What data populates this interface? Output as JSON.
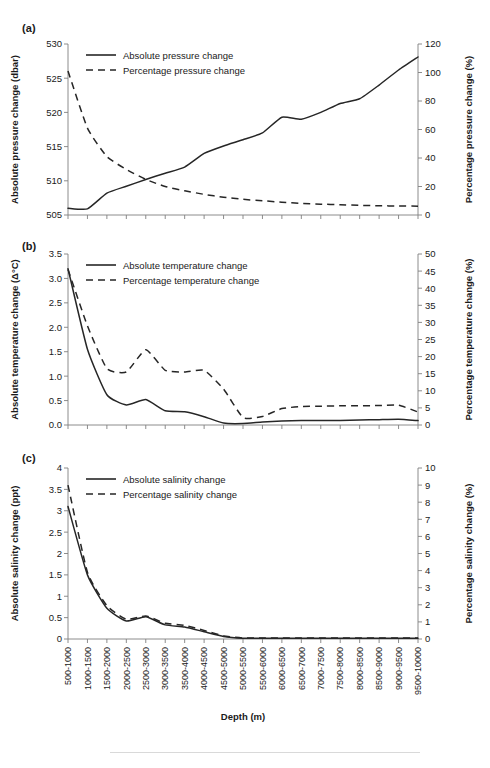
{
  "figure": {
    "xlabel": "Depth (m)",
    "categories": [
      "500-1000",
      "1000-1500",
      "1500-2000",
      "2000-2500",
      "2500-3000",
      "3000-3500",
      "3500-4000",
      "4000-4500",
      "4500-5000",
      "5000-5500",
      "5500-6000",
      "6000-6500",
      "6500-7000",
      "7000-7500",
      "7500-8000",
      "8000-8500",
      "8500-9000",
      "9000-9500",
      "9500-10000"
    ]
  },
  "panels": [
    {
      "tag": "(a)",
      "ylabel_left": "Absolute pressure change (dbar)",
      "ylabel_right": "Percentage pressure change (%)",
      "yticks_left": [
        "505",
        "510",
        "515",
        "520",
        "525",
        "530"
      ],
      "yticks_right": [
        "0",
        "20",
        "40",
        "60",
        "80",
        "100",
        "120"
      ],
      "legend": [
        "Absolute pressure change",
        "Percentage pressure change"
      ]
    },
    {
      "tag": "(b)",
      "ylabel_left": "Absolute temperature change (Δ°C)",
      "ylabel_right": "Percentage temperature change (%)",
      "yticks_left": [
        "0.0",
        "0.5",
        "1.0",
        "1.5",
        "2.0",
        "2.5",
        "3.0",
        "3.5"
      ],
      "yticks_right": [
        "0",
        "5",
        "10",
        "15",
        "20",
        "25",
        "30",
        "35",
        "40",
        "45",
        "50"
      ],
      "legend": [
        "Absolute temperature change",
        "Percentage temperature change"
      ]
    },
    {
      "tag": "(c)",
      "ylabel_left": "Absolute salinity change (ppt)",
      "ylabel_right": "Percentage salinity change (%)",
      "yticks_left": [
        "0",
        "0.5",
        "1",
        "1.5",
        "2",
        "2.5",
        "3",
        "3.5",
        "4"
      ],
      "yticks_right": [
        "0",
        "1",
        "2",
        "3",
        "4",
        "5",
        "6",
        "7",
        "8",
        "9",
        "10"
      ],
      "legend": [
        "Absolute salinity change",
        "Percentage salinity change"
      ]
    }
  ],
  "chart_data": [
    {
      "type": "line",
      "panel": "(a)",
      "title": "",
      "xlabel": "Depth (m)",
      "ylabel": "Absolute pressure change (dbar)",
      "ylabel_right": "Percentage pressure change (%)",
      "grid": false,
      "legend_position": "top-left",
      "categories": [
        "500-1000",
        "1000-1500",
        "1500-2000",
        "2000-2500",
        "2500-3000",
        "3000-3500",
        "3500-4000",
        "4000-4500",
        "4500-5000",
        "5000-5500",
        "5500-6000",
        "6000-6500",
        "6500-7000",
        "7000-7500",
        "7500-8000",
        "8000-8500",
        "8500-9000",
        "9000-9500",
        "9500-10000"
      ],
      "ylim": [
        505,
        530
      ],
      "ylim_right": [
        0,
        120
      ],
      "series": [
        {
          "name": "Absolute pressure change",
          "axis": "left",
          "style": "solid",
          "values": [
            506.0,
            505.9,
            508.2,
            509.2,
            510.2,
            511.1,
            512.0,
            514.0,
            515.1,
            516.0,
            517.0,
            519.3,
            519.0,
            520.0,
            521.3,
            522.0,
            524.0,
            526.2,
            528.1
          ]
        },
        {
          "name": "Percentage pressure change",
          "axis": "right",
          "style": "dashed",
          "values": [
            101.0,
            61.0,
            41.0,
            32.0,
            25.0,
            20.0,
            17.0,
            14.5,
            12.5,
            11.0,
            10.0,
            9.0,
            8.2,
            7.6,
            7.2,
            6.8,
            6.5,
            6.3,
            6.2
          ]
        }
      ]
    },
    {
      "type": "line",
      "panel": "(b)",
      "title": "",
      "xlabel": "Depth (m)",
      "ylabel": "Absolute temperature change (Δ°C)",
      "ylabel_right": "Percentage temperature change (%)",
      "grid": false,
      "legend_position": "top-left",
      "categories": [
        "500-1000",
        "1000-1500",
        "1500-2000",
        "2000-2500",
        "2500-3000",
        "3000-3500",
        "3500-4000",
        "4000-4500",
        "4500-5000",
        "5000-5500",
        "5500-6000",
        "6000-6500",
        "6500-7000",
        "7000-7500",
        "7500-8000",
        "8000-8500",
        "8500-9000",
        "9000-9500",
        "9500-10000"
      ],
      "ylim": [
        0.0,
        3.5
      ],
      "ylim_right": [
        0,
        50
      ],
      "series": [
        {
          "name": "Absolute temperature change",
          "axis": "left",
          "style": "solid",
          "values": [
            3.2,
            1.55,
            0.62,
            0.41,
            0.52,
            0.29,
            0.27,
            0.17,
            0.04,
            0.03,
            0.06,
            0.08,
            0.09,
            0.09,
            0.09,
            0.1,
            0.11,
            0.12,
            0.09
          ]
        },
        {
          "name": "Percentage temperature change",
          "axis": "right",
          "style": "dashed",
          "values": [
            45.5,
            29.0,
            16.5,
            15.5,
            22.0,
            16.0,
            15.5,
            16.0,
            10.5,
            2.2,
            2.5,
            4.8,
            5.4,
            5.5,
            5.6,
            5.6,
            5.7,
            5.8,
            3.8
          ]
        }
      ]
    },
    {
      "type": "line",
      "panel": "(c)",
      "title": "",
      "xlabel": "Depth (m)",
      "ylabel": "Absolute salinity change (ppt)",
      "ylabel_right": "Percentage salinity change (%)",
      "grid": false,
      "legend_position": "top-left",
      "categories": [
        "500-1000",
        "1000-1500",
        "1500-2000",
        "2000-2500",
        "2500-3000",
        "3000-3500",
        "3500-4000",
        "4000-4500",
        "4500-5000",
        "5000-5500",
        "5500-6000",
        "6000-6500",
        "6500-7000",
        "7000-7500",
        "7500-8000",
        "8000-8500",
        "8500-9000",
        "9000-9500",
        "9500-10000"
      ],
      "ylim": [
        0,
        4
      ],
      "ylim_right": [
        0,
        10
      ],
      "series": [
        {
          "name": "Absolute salinity change",
          "axis": "left",
          "style": "solid",
          "values": [
            3.1,
            1.5,
            0.72,
            0.42,
            0.52,
            0.33,
            0.28,
            0.17,
            0.06,
            0.02,
            0.02,
            0.02,
            0.02,
            0.02,
            0.02,
            0.02,
            0.02,
            0.02,
            0.02
          ]
        },
        {
          "name": "Percentage salinity change",
          "axis": "right",
          "style": "dashed",
          "values": [
            9.0,
            3.9,
            1.95,
            1.15,
            1.35,
            0.92,
            0.8,
            0.5,
            0.18,
            0.06,
            0.06,
            0.06,
            0.06,
            0.06,
            0.06,
            0.06,
            0.06,
            0.06,
            0.06
          ]
        }
      ]
    }
  ]
}
